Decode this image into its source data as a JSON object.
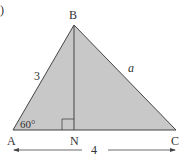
{
  "diagram": {
    "fragment": ")",
    "vertices": {
      "A": {
        "label": "A",
        "x": 13,
        "y": 130
      },
      "B": {
        "label": "B",
        "x": 74,
        "y": 25
      },
      "N": {
        "label": "N",
        "x": 74,
        "y": 130
      },
      "C": {
        "label": "C",
        "x": 176,
        "y": 130
      }
    },
    "labels": {
      "side_AB": "3",
      "side_BC": "a",
      "angle_A": "60°",
      "base_AC": "4"
    },
    "colors": {
      "fill": "#c8c8c8",
      "stroke": "#444444"
    }
  }
}
